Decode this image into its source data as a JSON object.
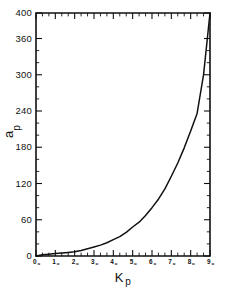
{
  "chart_data": {
    "type": "line",
    "title": "",
    "xlabel": "Kp",
    "ylabel": "ap",
    "xlabel_main": "K",
    "xlabel_sub": "p",
    "ylabel_main": "a",
    "ylabel_sub": "p",
    "grid": false,
    "legend": null,
    "xlim": [
      0,
      9
    ],
    "ylim": [
      0,
      400
    ],
    "x_tick_labels": [
      "0o",
      "1o",
      "2o",
      "3o",
      "4o",
      "5o",
      "6o",
      "7o",
      "8o",
      "9o"
    ],
    "x_tick_values": [
      0,
      1,
      2,
      3,
      4,
      5,
      6,
      7,
      8,
      9
    ],
    "x_tick_digits": [
      "0",
      "1",
      "2",
      "3",
      "4",
      "5",
      "6",
      "7",
      "8",
      "9"
    ],
    "x_tick_suffix": "o",
    "x_minor_tick_step": 0.3333,
    "y_tick_labels": [
      "0",
      "60",
      "120",
      "180",
      "240",
      "300",
      "360",
      "400"
    ],
    "y_tick_values": [
      0,
      60,
      120,
      180,
      240,
      300,
      360,
      400
    ],
    "y_minor_tick_step": 20,
    "series": [
      {
        "name": "ap",
        "x": [
          0,
          0.333,
          0.667,
          1,
          1.333,
          1.667,
          2,
          2.333,
          2.667,
          3,
          3.333,
          3.667,
          4,
          4.333,
          4.667,
          5,
          5.333,
          5.667,
          6,
          6.333,
          6.667,
          7,
          7.333,
          7.667,
          8,
          8.333,
          8.667,
          9
        ],
        "values": [
          0,
          2,
          3,
          4,
          5,
          6,
          7,
          9,
          12,
          15,
          18,
          22,
          27,
          32,
          39,
          48,
          56,
          67,
          80,
          94,
          111,
          132,
          154,
          179,
          207,
          236,
          300,
          400
        ]
      }
    ],
    "curve_color": "#111111",
    "axis_color": "#111111",
    "background_color": "#ffffff"
  },
  "figure": {
    "frame": {
      "left_px": 36,
      "right_px": 210,
      "top_px": 13,
      "bottom_px": 256
    }
  }
}
